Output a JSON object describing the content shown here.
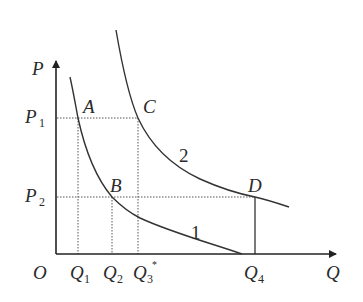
{
  "diagram": {
    "type": "economics-demand-curves",
    "axes": {
      "x_label": "Q",
      "y_label": "P",
      "origin_label": "O"
    },
    "price_levels": [
      {
        "id": "P1",
        "label": "P",
        "subscript": "1"
      },
      {
        "id": "P2",
        "label": "P",
        "subscript": "2"
      }
    ],
    "quantity_levels": [
      {
        "id": "Q1",
        "label": "Q",
        "subscript": "1"
      },
      {
        "id": "Q2",
        "label": "Q",
        "subscript": "2"
      },
      {
        "id": "Q3",
        "label": "Q",
        "subscript": "3",
        "superscript": "*"
      },
      {
        "id": "Q4",
        "label": "Q",
        "subscript": "4"
      }
    ],
    "points": [
      {
        "label": "A",
        "price": "P1",
        "quantity": "Q1",
        "curve": "1"
      },
      {
        "label": "B",
        "price": "P2",
        "quantity": "Q2",
        "curve": "1"
      },
      {
        "label": "C",
        "price": "P1",
        "quantity": "Q3",
        "curve": "2"
      },
      {
        "label": "D",
        "price": "P2",
        "quantity": "Q4",
        "curve": "2"
      }
    ],
    "curves": [
      {
        "label": "1",
        "description": "lower demand curve through A and B"
      },
      {
        "label": "2",
        "description": "higher demand curve through C and D"
      }
    ],
    "colors": {
      "line": "#333333",
      "dotted": "#555555",
      "background": "#ffffff"
    }
  }
}
